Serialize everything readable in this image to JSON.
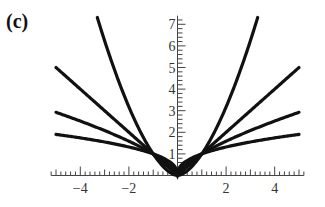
{
  "panel_label": "(c)",
  "chart_data": {
    "type": "line",
    "title": "",
    "xlabel": "",
    "ylabel": "",
    "xlim": [
      -5.2,
      5.2
    ],
    "ylim": [
      0,
      7.4
    ],
    "x_ticks": [
      -4,
      -2,
      2,
      4
    ],
    "x_tick_labels": [
      "−4",
      "−2",
      "2",
      "4"
    ],
    "y_ticks": [
      1,
      2,
      3,
      4,
      5,
      6,
      7
    ],
    "y_tick_labels": [
      "1",
      "2",
      "3",
      "4",
      "5",
      "6",
      "7"
    ],
    "grid": false,
    "legend": null,
    "series": [
      {
        "name": "|x|^(2/5)",
        "exponent": 0.4,
        "x_range": [
          -5,
          5
        ],
        "endpoint_y": 1.9
      },
      {
        "name": "|x|^(2/3)",
        "exponent": 0.6667,
        "x_range": [
          -5,
          5
        ],
        "endpoint_y": 2.92
      },
      {
        "name": "|x|",
        "exponent": 1,
        "x_range": [
          -5,
          5
        ],
        "endpoint_y": 5
      },
      {
        "name": "|x|^(5/3)",
        "exponent": 1.6667,
        "x_range": [
          -3.3,
          3.3
        ],
        "endpoint_y": 7.3
      }
    ],
    "color": "#111111"
  }
}
